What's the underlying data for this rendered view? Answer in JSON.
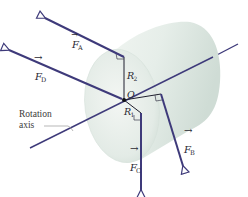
{
  "diagram": {
    "colors": {
      "force_vector": "#3e3a7a",
      "cylinder_light": "#eef3ef",
      "cylinder_shadow": "#c9d8d0",
      "label": "#2a2a33",
      "axis_leader": "#9a9a9a"
    },
    "labels": {
      "force_a": "F",
      "force_a_sub": "A",
      "force_b": "F",
      "force_b_sub": "B",
      "force_c": "F",
      "force_c_sub": "C",
      "force_d": "F",
      "force_d_sub": "D",
      "radius_2": "R",
      "radius_2_sub": "2",
      "radius_1": "R",
      "radius_1_sub": "1",
      "origin": "O",
      "rotation_axis_line1": "Rotation",
      "rotation_axis_line2": "axis"
    },
    "vector_arrow_glyph": "→"
  }
}
